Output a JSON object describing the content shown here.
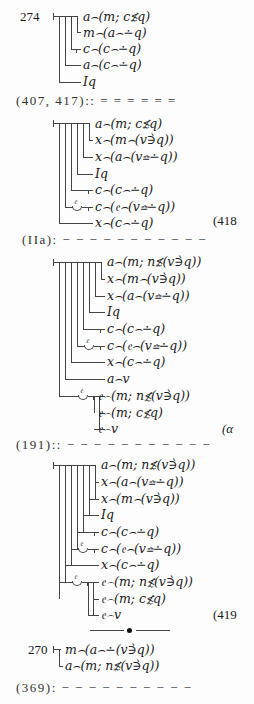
{
  "blocks": [
    {
      "label": "274",
      "rows": [
        "a⌢(m; c≴q)",
        "m⌢(a⌢∸q)",
        "c⌢(c⌢∸q)",
        "a⌢(c⌢∸q)",
        "Iq"
      ]
    },
    {
      "separator": "(407, 417):: = = = = = =",
      "rows": [
        "a⌢(m; c≴q)",
        "x⌢(m⌢(v∋̀q))",
        "x⌢(a⌢(v≏∸q))",
        "Iq",
        "c⌢(c⌢∸q)",
        "c⌢(𝔢⌢(v≏∸q))",
        "x⌢(c⌢∸q)"
      ],
      "eq_number": "(418",
      "curl_glyph": "𝔢"
    },
    {
      "separator": "(IIa): − − − − − − − − − − −",
      "rows": [
        "a⌢(m; n≴(v∋̀q))",
        "x⌢(m⌢(v∋̀q))",
        "x⌢(a⌢(v≏∸q))",
        "Iq",
        "c⌢(c⌢∸q)",
        "c⌢(𝔢⌢(v≏∸q))",
        "x⌢(c⌢∸q)",
        "a⌢v",
        "𝔢⌢(m; n≴(v∋̀q))",
        "𝔢⌢(m; c≴q)",
        "𝔢⌢v"
      ],
      "eq_number": "(α",
      "curl_glyph": "𝔢"
    },
    {
      "separator": "(191):: − − − − − − − − − − −",
      "rows": [
        "a⌢(m; n≴(v∋̀q))",
        "x⌢(a⌢(v≏∸q))",
        "x⌢(m⌢(v∋̀q))",
        "Iq",
        "c⌢(c⌢∸q)",
        "c⌢(𝔢⌢(v≏∸q))",
        "x⌢(c⌢∸q)",
        "𝔢⌢(m; n≴(v∋̀q))",
        "𝔢⌢(m; c≴q)",
        "𝔢⌢v"
      ],
      "eq_number": "(419",
      "curl_glyph": "𝔢"
    },
    {
      "label": "270",
      "rows": [
        "m⌢(a⌢∸(v∋̀q))",
        "a⌢(m; n≴(v∋̀q))"
      ]
    }
  ],
  "footer_separator": "(369): − − − − − − − − − −"
}
